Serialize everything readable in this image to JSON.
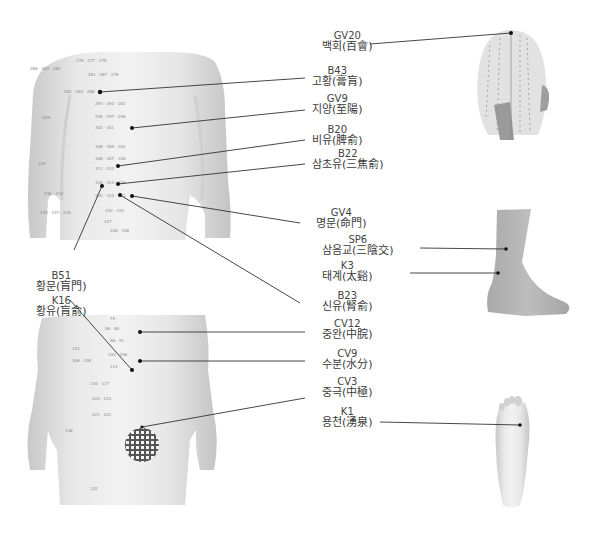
{
  "diagram": {
    "type": "acupuncture-point-chart",
    "figures": [
      "back-torso",
      "front-torso",
      "head-back",
      "lower-leg-side",
      "foot-sole"
    ],
    "colors": {
      "skin": "#e4e4e4",
      "skin_shadow": "#c9c9c9",
      "leader_line": "#333333",
      "point": "#111111",
      "text": "#3a3a3a"
    }
  },
  "labels": [
    {
      "id": "GV20",
      "code": "GV20",
      "name": "백회(百會)",
      "figure": "head-back"
    },
    {
      "id": "B43",
      "code": "B43",
      "name": "고황(膏肓)",
      "figure": "back-torso"
    },
    {
      "id": "GV9",
      "code": "GV9",
      "name": "지양(至陽)",
      "figure": "back-torso"
    },
    {
      "id": "B20",
      "code": "B20",
      "name": "비유(脾俞)",
      "figure": "back-torso"
    },
    {
      "id": "B22",
      "code": "B22",
      "name": "삼초유(三焦俞)",
      "figure": "back-torso"
    },
    {
      "id": "GV4",
      "code": "GV4",
      "name": "명문(命門)",
      "figure": "back-torso"
    },
    {
      "id": "SP6",
      "code": "SP6",
      "name": "삼음교(三陰交)",
      "figure": "lower-leg-side"
    },
    {
      "id": "K3",
      "code": "K3",
      "name": "태계(太谿)",
      "figure": "lower-leg-side"
    },
    {
      "id": "B51",
      "code": "B51",
      "name": "황문(肓門)",
      "figure": "back-torso"
    },
    {
      "id": "B23",
      "code": "B23",
      "name": "신유(腎俞)",
      "figure": "back-torso"
    },
    {
      "id": "K16",
      "code": "K16",
      "name": "황유(肓俞)",
      "figure": "front-torso"
    },
    {
      "id": "CV12",
      "code": "CV12",
      "name": "중완(中脘)",
      "figure": "front-torso"
    },
    {
      "id": "CV9",
      "code": "CV9",
      "name": "수분(水分)",
      "figure": "front-torso"
    },
    {
      "id": "CV3",
      "code": "CV3",
      "name": "중극(中極)",
      "figure": "front-torso"
    },
    {
      "id": "K1",
      "code": "K1",
      "name": "용천(湧泉)",
      "figure": "foot-sole"
    }
  ]
}
